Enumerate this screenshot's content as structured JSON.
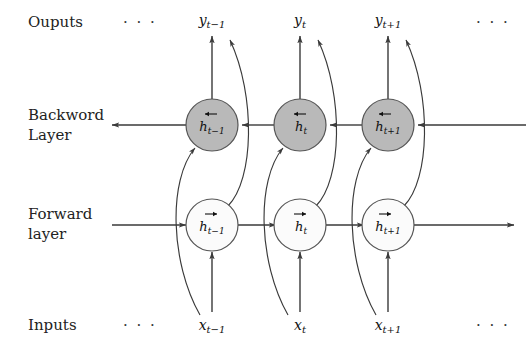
{
  "figure": {
    "background_color": "#ffffff",
    "line_color": "#3a3a3a",
    "backward_node_fill": "#b9b9b9",
    "forward_node_fill": "#fbfbfb"
  },
  "row_labels": {
    "outputs": "Ouputs",
    "backward_line1": "Backword",
    "backward_line2": "Layer",
    "forward_line1": "Forward",
    "forward_line2": "layer",
    "inputs": "Inputs"
  },
  "ellipses": {
    "outputs_left": "· · ·",
    "outputs_right": "· · ·",
    "inputs_left": "· · ·",
    "inputs_right": "· · ·"
  },
  "timesteps": [
    {
      "key": "t-1",
      "output_base": "y",
      "output_sub": "t−1",
      "backward_base": "h",
      "backward_sub": "t−1",
      "forward_base": "h",
      "forward_sub": "t−1",
      "input_base": "x",
      "input_sub": "t−1"
    },
    {
      "key": "t",
      "output_base": "y",
      "output_sub": "t",
      "backward_base": "h",
      "backward_sub": "t",
      "forward_base": "h",
      "forward_sub": "t",
      "input_base": "x",
      "input_sub": "t"
    },
    {
      "key": "t+1",
      "output_base": "y",
      "output_sub": "t+1",
      "backward_base": "h",
      "backward_sub": "t+1",
      "forward_base": "h",
      "forward_sub": "t+1",
      "input_base": "x",
      "input_sub": "t+1"
    }
  ],
  "accents": {
    "backward": "left-arrow-accent",
    "forward": "right-arrow-accent"
  }
}
